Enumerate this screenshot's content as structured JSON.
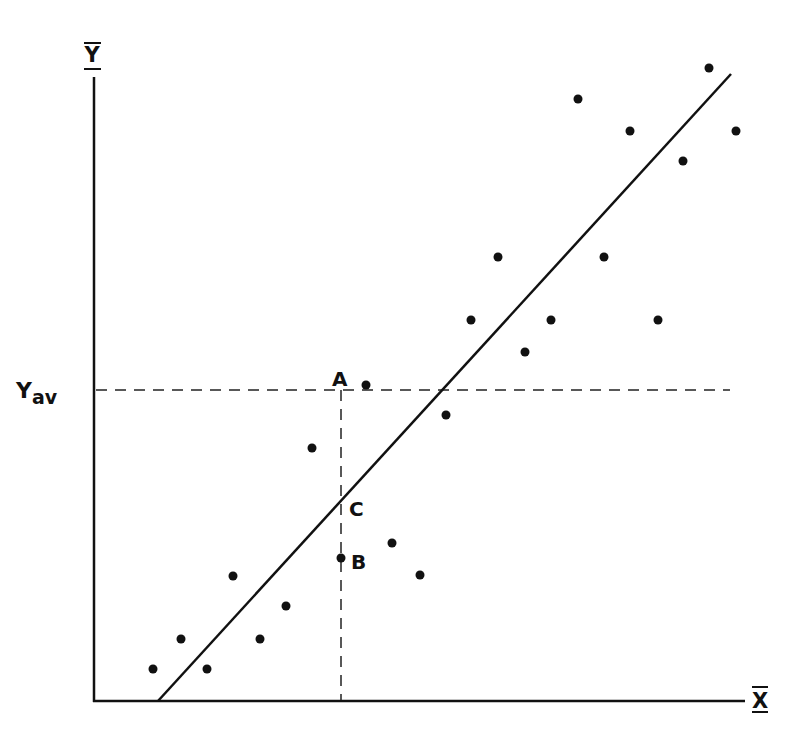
{
  "chart_data": {
    "type": "scatter",
    "title": "",
    "xlabel": "X̄",
    "ylabel": "Ȳ",
    "grid": false,
    "legend": null,
    "axes_px": {
      "origin": [
        94,
        701
      ],
      "x_end": 745,
      "y_top": 77
    },
    "points_px": [
      [
        153,
        669
      ],
      [
        181,
        639
      ],
      [
        207,
        669
      ],
      [
        233,
        576
      ],
      [
        260,
        639
      ],
      [
        286,
        606
      ],
      [
        312,
        448
      ],
      [
        341,
        558
      ],
      [
        366,
        385
      ],
      [
        392,
        543
      ],
      [
        420,
        575
      ],
      [
        446,
        415
      ],
      [
        471,
        320
      ],
      [
        498,
        257
      ],
      [
        525,
        352
      ],
      [
        551,
        320
      ],
      [
        578,
        99
      ],
      [
        604,
        257
      ],
      [
        630,
        131
      ],
      [
        658,
        320
      ],
      [
        683,
        161
      ],
      [
        709,
        68
      ],
      [
        736,
        131
      ]
    ],
    "regression_line_px": {
      "x1": 158,
      "y1": 701,
      "x2": 731,
      "y2": 74
    },
    "y_average": {
      "label": "Y",
      "subscript": "av",
      "y_px": 390,
      "x_start": 95,
      "x_end": 730
    },
    "reference_x": {
      "x_px": 341,
      "y_top": 390,
      "y_bottom": 701
    },
    "annotations": [
      {
        "text": "A",
        "x_px": 341,
        "y_px": 378,
        "meaning": "point on Y average line"
      },
      {
        "text": "C",
        "x_px": 341,
        "y_px": 502,
        "meaning": "point on regression line"
      },
      {
        "text": "B",
        "x_px": 341,
        "y_px": 558,
        "meaning": "observed data point"
      }
    ]
  },
  "labels": {
    "y_axis": "Y",
    "x_axis": "X",
    "y_av_main": "Y",
    "y_av_sub": "av",
    "point_a": "A",
    "point_b": "B",
    "point_c": "C"
  },
  "colors": {
    "ink": "#111111",
    "background": "#ffffff"
  }
}
